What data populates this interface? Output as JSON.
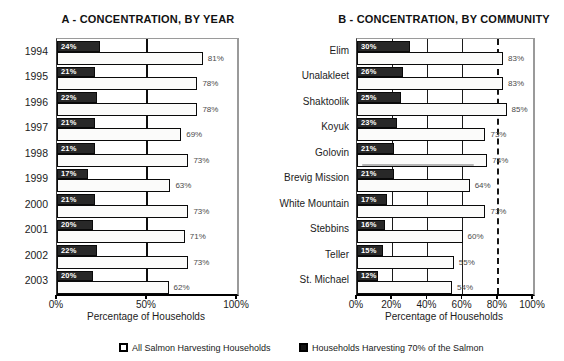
{
  "colors": {
    "dark_bar": "#282828",
    "white_bar": "#fbfbfa",
    "frame_gray": "#9a9a9a",
    "value_label": "#4a4a4a"
  },
  "legend": {
    "items": [
      {
        "label": "All Salmon Harvesting Households",
        "swatch": "open"
      },
      {
        "label": "Households Harvesting 70% of the Salmon",
        "swatch": "filled"
      }
    ]
  },
  "chart_data": [
    {
      "type": "bar",
      "orientation": "horizontal",
      "title": "A - CONCENTRATION, BY YEAR",
      "xlabel": "Percentage of Households",
      "xlim": [
        0,
        100
      ],
      "x_ticks": [
        0,
        50,
        100
      ],
      "x_tick_labels": [
        "0%",
        "50%",
        "100%"
      ],
      "gridlines_solid": [
        50
      ],
      "gridline_dashed": null,
      "categories": [
        "1994",
        "1995",
        "1996",
        "1997",
        "1998",
        "1999",
        "2000",
        "2001",
        "2002",
        "2003"
      ],
      "series": [
        {
          "name": "Households Harvesting 70% of the Salmon",
          "style": "dark",
          "values": [
            24,
            21,
            22,
            21,
            21,
            17,
            21,
            20,
            22,
            20
          ]
        },
        {
          "name": "All Salmon Harvesting Households",
          "style": "open",
          "values": [
            81,
            78,
            78,
            69,
            73,
            63,
            73,
            71,
            73,
            62
          ]
        }
      ]
    },
    {
      "type": "bar",
      "orientation": "horizontal",
      "title": "B - CONCENTRATION, BY COMMUNITY",
      "xlabel": "Percentage of Households",
      "xlim": [
        0,
        100
      ],
      "x_ticks": [
        0,
        20,
        40,
        60,
        80,
        100
      ],
      "x_tick_labels": [
        "0%",
        "20%",
        "40%",
        "60%",
        "80%",
        "100%"
      ],
      "gridlines_solid": [
        20,
        40,
        60
      ],
      "gridline_dashed": 80,
      "categories": [
        "Elim",
        "Unalakleet",
        "Shaktoolik",
        "Koyuk",
        "Golovin",
        "Brevig Mission",
        "White Mountain",
        "Stebbins",
        "Teller",
        "St. Michael"
      ],
      "series": [
        {
          "name": "Households Harvesting 70% of the Salmon",
          "style": "dark",
          "values": [
            30,
            26,
            25,
            23,
            21,
            21,
            17,
            16,
            15,
            12
          ]
        },
        {
          "name": "All Salmon Harvesting Households",
          "style": "open",
          "values": [
            83,
            83,
            85,
            73,
            74,
            64,
            73,
            60,
            55,
            54
          ]
        }
      ]
    }
  ]
}
